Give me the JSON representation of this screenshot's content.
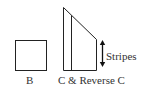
{
  "diagram": {
    "shapes": [
      {
        "id": "B",
        "type": "square",
        "label": "B"
      },
      {
        "id": "C",
        "type": "trapezoid-with-divider",
        "label": "C & Reverse C"
      }
    ],
    "annotation": {
      "label": "Stripes",
      "icon": "double-arrow-vertical-icon"
    },
    "colors": {
      "stroke": "#222222",
      "text": "#333333",
      "background": "#ffffff"
    }
  }
}
